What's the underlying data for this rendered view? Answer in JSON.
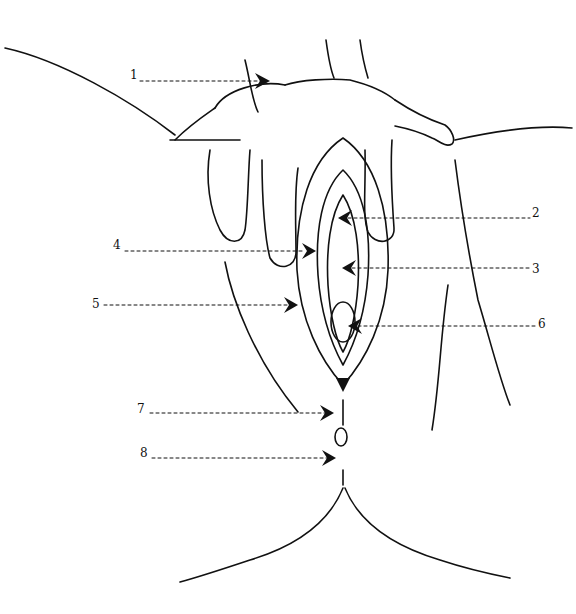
{
  "diagram": {
    "type": "anatomical line drawing",
    "labels": [
      {
        "id": "1",
        "text": "1",
        "x": 130,
        "y": 68
      },
      {
        "id": "2",
        "text": "2",
        "x": 532,
        "y": 206
      },
      {
        "id": "3",
        "text": "3",
        "x": 532,
        "y": 262
      },
      {
        "id": "4",
        "text": "4",
        "x": 113,
        "y": 238
      },
      {
        "id": "5",
        "text": "5",
        "x": 92,
        "y": 297
      },
      {
        "id": "6",
        "text": "6",
        "x": 538,
        "y": 317
      },
      {
        "id": "7",
        "text": "7",
        "x": 137,
        "y": 402
      },
      {
        "id": "8",
        "text": "8",
        "x": 140,
        "y": 446
      }
    ]
  }
}
